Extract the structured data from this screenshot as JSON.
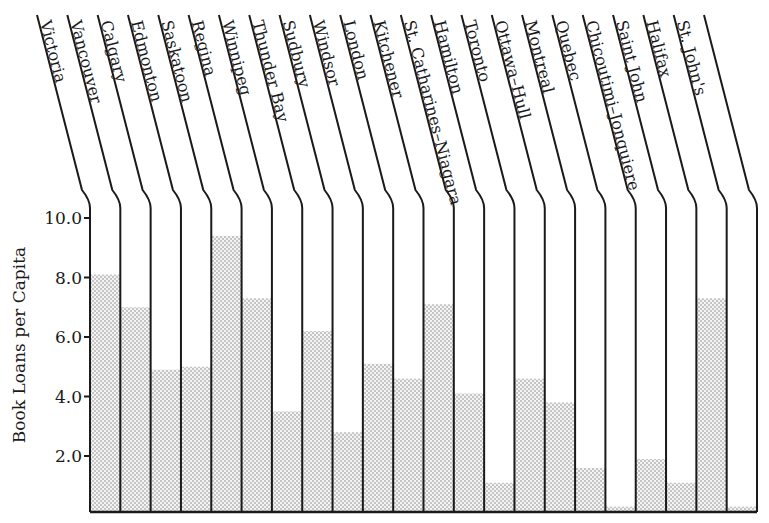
{
  "chart_data": {
    "type": "bar",
    "title": "",
    "xlabel": "",
    "ylabel": "Book Loans per Capita",
    "ylim": [
      0,
      10.0
    ],
    "yticks": [
      "2.0",
      "4.0",
      "6.0",
      "8.0",
      "10.0"
    ],
    "grid": false,
    "legend": null,
    "categories": [
      "Victoria",
      "Vancouver",
      "Calgary",
      "Edmonton",
      "Saskatoon",
      "Regina",
      "Winnipeg",
      "Thunder Bay",
      "Sudbury",
      "Windsor",
      "London",
      "Kitchener",
      "St. Catharines–Niagara",
      "Hamilton",
      "Toronto",
      "Ottawa–Hull",
      "Montreal",
      "Quebec",
      "Chicoutimi–Jonquiere",
      "Saint John",
      "Halifax",
      "St. John's"
    ],
    "values": [
      8.1,
      7.0,
      4.9,
      5.0,
      9.4,
      7.3,
      3.5,
      6.2,
      2.8,
      5.1,
      4.6,
      7.1,
      4.1,
      1.1,
      4.6,
      3.8,
      1.6,
      0.3,
      1.9,
      1.1,
      7.3,
      0.3
    ],
    "fill": "stippled gray dots",
    "label_orientation": "rotated, slanted column headers"
  },
  "axis": {
    "ylabel": "Book Loans per Capita",
    "ticks": [
      "10.0",
      "8.0",
      "6.0",
      "4.0",
      "2.0"
    ]
  }
}
